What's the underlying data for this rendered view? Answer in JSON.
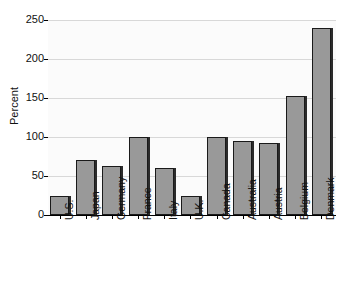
{
  "chart_data": {
    "type": "bar",
    "title": "",
    "xlabel": "",
    "ylabel": "Percent",
    "ylim": [
      0,
      250
    ],
    "yticks": [
      0,
      50,
      100,
      150,
      200,
      250
    ],
    "ytick_labels": [
      "0",
      "50",
      "100",
      "150",
      "200",
      "250"
    ],
    "grid": true,
    "legend": "none",
    "orientation": "vertical",
    "categories": [
      "U.S.",
      "Japan",
      "Germany",
      "France",
      "Italy",
      "U.K.",
      "Canada",
      "Australia",
      "Austria",
      "Belgium",
      "Denmark"
    ],
    "values": [
      25,
      70,
      63,
      100,
      60,
      25,
      100,
      95,
      92,
      152,
      240
    ],
    "bar_color": "#999999",
    "bar_edge_color": "#1a1a1a",
    "plot_background": "#fbfbfb",
    "gridline_color": "#d8d8d8",
    "axis_color": "#000000"
  }
}
